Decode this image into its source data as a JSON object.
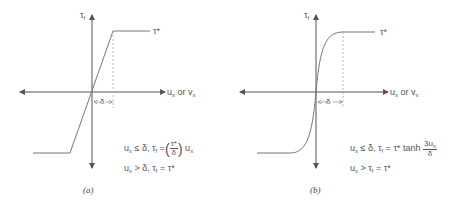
{
  "panels": [
    {
      "id": "a",
      "caption": "(a)",
      "y_axis_label": "τ",
      "y_axis_sub": "f",
      "x_axis_label_a": "u",
      "x_axis_label_sub": "x",
      "x_axis_label_or": "or v",
      "x_axis_label_sub2": "x",
      "plateau_label": "τ*",
      "delta_label": "δ",
      "curve_type": "linear-elastic-plastic",
      "eq1_prefix": "u",
      "eq1_sub": "x",
      "eq1_mid": " ≤ δ, τ",
      "eq1_sub2": "f",
      "eq1_eq": " =",
      "eq1_frac_num": "τ*",
      "eq1_frac_den": "δ",
      "eq1_tail": "u",
      "eq1_tail_sub": "x",
      "eq2_prefix": "u",
      "eq2_sub": "x",
      "eq2_mid": " > δ, τ",
      "eq2_sub2": "f",
      "eq2_tail": " = τ*"
    },
    {
      "id": "b",
      "caption": "(b)",
      "y_axis_label": "τ",
      "y_axis_sub": "f",
      "x_axis_label_a": "u",
      "x_axis_label_sub": "x",
      "x_axis_label_or": "or v",
      "x_axis_label_sub2": "x",
      "plateau_label": "τ*",
      "delta_label": "δ",
      "curve_type": "hyperbolic-tangent",
      "eq1_prefix": "u",
      "eq1_sub": "x",
      "eq1_mid": " ≤ δ, τ",
      "eq1_sub2": "f",
      "eq1_eq": " = τ* tanh ",
      "eq1_frac_num": "3u",
      "eq1_frac_num_sub": "x",
      "eq1_frac_den": "δ",
      "eq2_prefix": "u",
      "eq2_sub": "x",
      "eq2_mid": " > τ",
      "eq2_sub2": "f",
      "eq2_tail": " = τ*"
    }
  ],
  "colors": {
    "line": "#666666",
    "dashed": "#999999",
    "text": "#555555"
  }
}
